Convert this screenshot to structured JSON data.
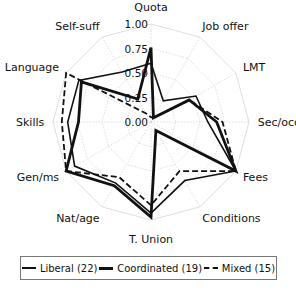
{
  "chart_data": {
    "type": "radar",
    "axes": [
      "Quota",
      "Job offer",
      "LMT",
      "Sec/occ",
      "Fees",
      "Conditions",
      "T. Union",
      "Nat/age",
      "Gen/ms",
      "Skills",
      "Language",
      "Self-suff"
    ],
    "radial_ticks": [
      "0.00",
      "0.25",
      "0.50",
      "0.75",
      "1.00"
    ],
    "rlim": [
      0,
      1
    ],
    "grid": true,
    "legend_position": "bottom",
    "series": [
      {
        "name": "Liberal (22)",
        "style": "thin",
        "values": [
          0.6,
          0.25,
          0.53,
          0.58,
          1.0,
          0.69,
          0.93,
          0.72,
          0.9,
          0.85,
          0.85,
          0.59
        ]
      },
      {
        "name": "Coordinated (19)",
        "style": "thick",
        "values": [
          0.76,
          0.05,
          0.45,
          0.67,
          1.0,
          0.1,
          0.97,
          0.75,
          1.0,
          0.74,
          0.82,
          0.27
        ]
      },
      {
        "name": "Mixed (15)",
        "style": "dashed",
        "values": [
          0.05,
          0.05,
          0.45,
          0.73,
          1.0,
          0.58,
          0.85,
          0.65,
          1.0,
          0.91,
          1.0,
          0.1
        ]
      }
    ]
  },
  "legend": {
    "items": [
      {
        "label": "Liberal (22)"
      },
      {
        "label": "Coordinated (19)"
      },
      {
        "label": "Mixed (15)"
      }
    ]
  }
}
